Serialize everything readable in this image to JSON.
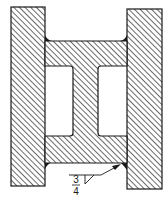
{
  "diagram": {
    "type": "welded-joint-cross-section",
    "parts": [
      {
        "name": "left-plate",
        "hatched": true
      },
      {
        "name": "right-plate",
        "hatched": true
      },
      {
        "name": "i-beam",
        "hatched": true
      }
    ],
    "welds": [
      {
        "name": "top-left-fillet-weld"
      },
      {
        "name": "top-right-fillet-weld"
      },
      {
        "name": "bottom-left-fillet-weld"
      },
      {
        "name": "bottom-right-fillet-weld"
      }
    ],
    "weld_symbol": {
      "type": "fillet",
      "size_numerator": "3",
      "size_denominator": "4"
    },
    "colors": {
      "line": "#1a1a1a",
      "background": "#ffffff"
    }
  }
}
